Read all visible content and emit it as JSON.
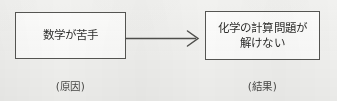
{
  "diagram": {
    "type": "cause-effect-flow",
    "background_color": "#f1f1ef",
    "line_color": "#555552",
    "text_color": "#2e2e2c",
    "nodes": [
      {
        "id": "cause",
        "text": "数学が苦手",
        "caption": "(原因)",
        "role": "cause"
      },
      {
        "id": "effect",
        "text": "化学の計算問題が\n解けない",
        "caption": "(結果)",
        "role": "effect"
      }
    ],
    "connector": {
      "id": "cause-to-effect",
      "style": "open-chevron-arrow",
      "direction": "left-to-right",
      "from": "cause",
      "to": "effect"
    }
  }
}
